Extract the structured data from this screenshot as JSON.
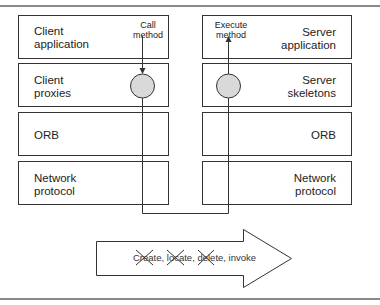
{
  "diagram": {
    "type": "layered-architecture",
    "client_stack": [
      {
        "label_line1": "Client",
        "label_line2": "application"
      },
      {
        "label_line1": "Client",
        "label_line2": "proxies"
      },
      {
        "label_line1": "ORB",
        "label_line2": ""
      },
      {
        "label_line1": "Network",
        "label_line2": "protocol"
      }
    ],
    "server_stack": [
      {
        "label_line1": "Server",
        "label_line2": "application"
      },
      {
        "label_line1": "Server",
        "label_line2": "skeletons"
      },
      {
        "label_line1": "ORB",
        "label_line2": ""
      },
      {
        "label_line1": "Network",
        "label_line2": "protocol"
      }
    ],
    "client_annotation": {
      "line1": "Call",
      "line2": "method"
    },
    "server_annotation": {
      "line1": "Execute",
      "line2": "method"
    },
    "arrow": {
      "text": "Create, locate, delete, invoke",
      "crossed_out": [
        "Create",
        "locate",
        "delete"
      ]
    },
    "colors": {
      "stroke": "#333333",
      "node_fill": "#d9d9d9",
      "rule": "#8a8a8a"
    }
  }
}
